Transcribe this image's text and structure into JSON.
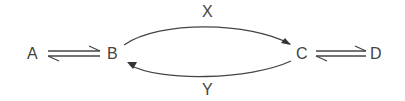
{
  "nodes": {
    "a": "A",
    "b": "B",
    "c": "C",
    "d": "D"
  },
  "edges": {
    "top_label": "X",
    "bottom_label": "Y"
  },
  "colors": {
    "stroke": "#444444",
    "background": "#ffffff"
  }
}
